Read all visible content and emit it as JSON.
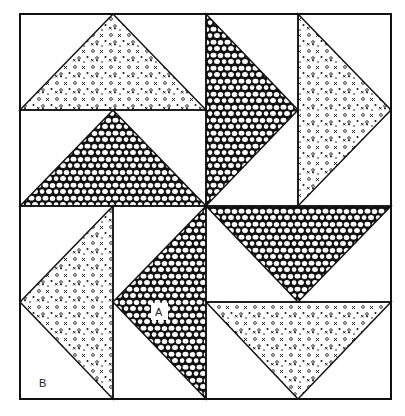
{
  "figure": {
    "title": "",
    "labels": {
      "a": "A",
      "b": "B"
    },
    "colors": {
      "line": "#111111",
      "background": "#ffffff"
    },
    "fabrics": [
      "dotted-xo-print",
      "pebble-print"
    ],
    "pieces": [
      {
        "name": "top-left-upper-triangle",
        "fabric": "dotted-xo-print"
      },
      {
        "name": "top-left-lower-triangle",
        "fabric": "pebble-print"
      },
      {
        "name": "top-right-left-triangle",
        "fabric": "pebble-print"
      },
      {
        "name": "top-right-right-triangle",
        "fabric": "dotted-xo-print"
      },
      {
        "name": "bottom-left-left-triangle",
        "fabric": "dotted-xo-print"
      },
      {
        "name": "bottom-left-right-triangle",
        "fabric": "pebble-print",
        "label": "A"
      },
      {
        "name": "bottom-right-upper-triangle",
        "fabric": "pebble-print"
      },
      {
        "name": "bottom-right-lower-triangle",
        "fabric": "dotted-xo-print"
      }
    ]
  }
}
